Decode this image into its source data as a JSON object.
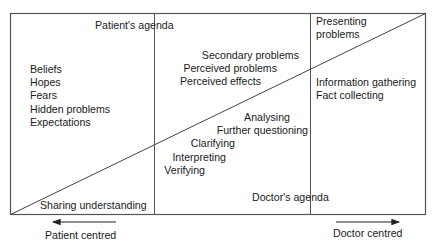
{
  "diagram": {
    "title_top": "Patient's agenda",
    "title_bottom": "Doctor's agenda",
    "left_column": [
      "Beliefs",
      "Hopes",
      "Fears",
      "Hidden problems",
      "Expectations"
    ],
    "middle_upper": [
      "Secondary problems",
      "Perceived problems",
      "Perceived effects"
    ],
    "middle_lower": [
      "Analysing",
      "Further questioning",
      "Clarifying",
      "Interpreting",
      "Verifying"
    ],
    "right_upper": [
      "Presenting",
      "problems"
    ],
    "right_lower": [
      "Information gathering",
      "Fact collecting"
    ],
    "bottom_left": "Sharing understanding",
    "arrow_left_label": "Patient centred",
    "arrow_right_label": "Doctor centred",
    "colors": {
      "line": "#4a4a4a",
      "text": "#1a1a1a",
      "background": "#ffffff"
    }
  }
}
